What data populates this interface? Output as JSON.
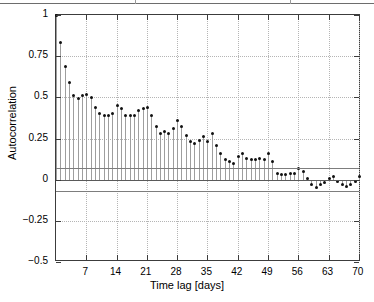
{
  "figure": {
    "kind": "autocorrelation-stem-plot",
    "background": "#ffffff",
    "marker_color": "#111111",
    "stem_color": "#9e9e9e",
    "bound_color": "#7d7d7d",
    "grid_color": "#b5b5b5",
    "axis_color": "#3c3c3c"
  },
  "chart_data": {
    "type": "line",
    "plot_style": "stem",
    "title": "",
    "subtitle": "",
    "xlabel": "Time lag [days]",
    "ylabel": "Autocorrelation",
    "xlim": [
      0,
      70.5
    ],
    "ylim": [
      -0.5,
      1.0
    ],
    "grid": true,
    "legend": null,
    "xticks": [
      7,
      14,
      21,
      28,
      35,
      42,
      49,
      56,
      63,
      70
    ],
    "xticklabels": [
      "7",
      "14",
      "21",
      "28",
      "35",
      "42",
      "49",
      "56",
      "63",
      "70"
    ],
    "yticks": [
      -0.5,
      -0.25,
      0,
      0.25,
      0.5,
      0.75,
      1
    ],
    "yticklabels": [
      "-0.5",
      "-0.25",
      "0",
      "0.25",
      "0.5",
      "0.75",
      "1"
    ],
    "confidence_bounds": [
      0.07,
      -0.07
    ],
    "zero_line": 0,
    "x": [
      0,
      1,
      2,
      3,
      4,
      5,
      6,
      7,
      8,
      9,
      10,
      11,
      12,
      13,
      14,
      15,
      16,
      17,
      18,
      19,
      20,
      21,
      22,
      23,
      24,
      25,
      26,
      27,
      28,
      29,
      30,
      31,
      32,
      33,
      34,
      35,
      36,
      37,
      38,
      39,
      40,
      41,
      42,
      43,
      44,
      45,
      46,
      47,
      48,
      49,
      50,
      51,
      52,
      53,
      54,
      55,
      56,
      57,
      58,
      59,
      60,
      61,
      62,
      63,
      64,
      65,
      66,
      67,
      68,
      69,
      70
    ],
    "values": [
      1.0,
      0.83,
      0.69,
      0.59,
      0.51,
      0.49,
      0.51,
      0.52,
      0.5,
      0.44,
      0.4,
      0.39,
      0.39,
      0.4,
      0.45,
      0.43,
      0.39,
      0.39,
      0.39,
      0.42,
      0.43,
      0.44,
      0.39,
      0.32,
      0.28,
      0.29,
      0.28,
      0.31,
      0.36,
      0.32,
      0.27,
      0.23,
      0.22,
      0.24,
      0.26,
      0.23,
      0.28,
      0.21,
      0.16,
      0.12,
      0.11,
      0.1,
      0.14,
      0.16,
      0.13,
      0.12,
      0.12,
      0.13,
      0.12,
      0.16,
      0.11,
      0.04,
      0.03,
      0.03,
      0.04,
      0.04,
      0.07,
      0.05,
      0.01,
      -0.03,
      -0.05,
      -0.03,
      -0.02,
      0.01,
      0.02,
      -0.01,
      -0.03,
      -0.04,
      -0.03,
      -0.01,
      0.02
    ]
  }
}
